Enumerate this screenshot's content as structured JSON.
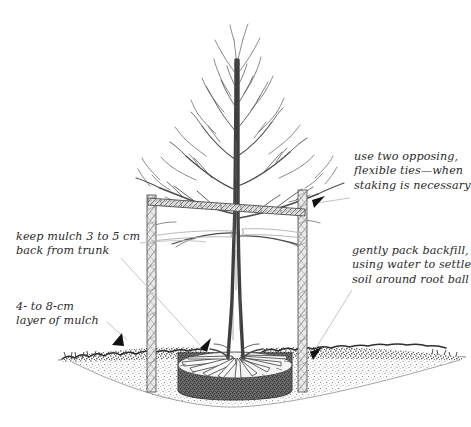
{
  "figure": {
    "kind": "line-illustration",
    "background_color": "#ffffff",
    "ink_color": "#4a4a4a",
    "dark_ink_color": "#1e1e1e",
    "leader_color": "#b8b8b8",
    "arrow_color": "#111111",
    "text_color": "#2b2b2b"
  },
  "annotations": [
    {
      "id": "mulch-gap",
      "lines": [
        "keep mulch 3 to 5 cm",
        "back from trunk"
      ],
      "side": "left"
    },
    {
      "id": "mulch-depth",
      "lines": [
        "4- to 8-cm",
        "layer of mulch"
      ],
      "side": "left"
    },
    {
      "id": "ties",
      "lines": [
        "use two opposing,",
        "flexible ties—when",
        "staking is necessary"
      ],
      "side": "right"
    },
    {
      "id": "backfill",
      "lines": [
        "gently pack backfill,",
        "using water to settle",
        "soil around root ball"
      ],
      "side": "right"
    }
  ],
  "parts": {
    "tree": "bare-deciduous-tree",
    "left_stake": "wooden-stake-left",
    "right_stake": "wooden-stake-right",
    "crossbar": "horizontal-crossbar",
    "ties": "flexible-tree-ties",
    "mulch_layer": "mulch-layer",
    "soil": "soil-cross-section",
    "planting_hole": "planting-hole",
    "root_ball": "root-ball",
    "roots": "radiating-roots",
    "grade_line": "ground-grade-line"
  }
}
